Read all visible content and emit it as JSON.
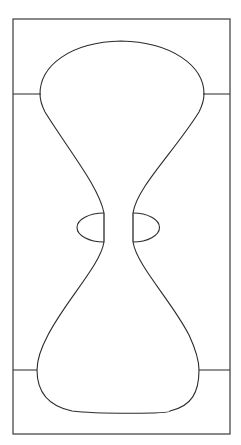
{
  "figure": {
    "title": "Hourglass outline drawing",
    "canvas": {
      "width": 241,
      "height": 445
    },
    "colors": {
      "background": "#ffffff",
      "frame_stroke": "#3a3a3a",
      "shape_stroke": "#2b2b2b"
    },
    "frame": {
      "name": "outer-rectangle",
      "x": 13,
      "y": 19,
      "width": 217,
      "height": 415
    },
    "ticks": [
      {
        "name": "tick-top-left",
        "x1": 13,
        "y1": 94,
        "x2": 41,
        "y2": 94
      },
      {
        "name": "tick-top-right",
        "x1": 203,
        "y1": 94,
        "x2": 230,
        "y2": 94
      },
      {
        "name": "tick-bottom-left",
        "x1": 13,
        "y1": 370,
        "x2": 37,
        "y2": 370
      },
      {
        "name": "tick-bottom-right",
        "x1": 199,
        "y1": 370,
        "x2": 230,
        "y2": 370
      }
    ],
    "upper_bulb": {
      "name": "upper-bulb-outline",
      "apex_y": 41,
      "shoulder_y": 94,
      "left_shoulder_x": 40,
      "right_shoulder_x": 204,
      "waist_top_y": 213,
      "waist_left_x": 104,
      "waist_right_x": 133,
      "path": "M 104,213 L 104,94.5 C 104,63 128,41.5 165,41.5 C 203,41.5 228,63 228,94.5 L 228,213"
    },
    "lower_bulb": {
      "name": "lower-bulb-outline",
      "base_y": 412,
      "shoulder_y": 370,
      "left_shoulder_x": 37,
      "right_shoulder_x": 199,
      "waist_bottom_y": 242,
      "waist_left_x": 104,
      "waist_right_x": 133
    },
    "waist_segments": [
      {
        "name": "waist-left-vertical",
        "x": 104,
        "y1": 213,
        "y2": 242
      },
      {
        "name": "waist-right-vertical",
        "x": 133,
        "y1": 213,
        "y2": 242
      }
    ],
    "ellipses": [
      {
        "name": "left-waist-ellipse",
        "left_x": 50,
        "right_x": 104,
        "top_y": 213,
        "bottom_y": 242,
        "cx": 77,
        "cy": 227.5,
        "rx": 27,
        "ry": 14.5
      },
      {
        "name": "right-waist-ellipse",
        "left_x": 133,
        "right_x": 186,
        "top_y": 213,
        "bottom_y": 242,
        "cx": 159.5,
        "cy": 227.5,
        "rx": 26.5,
        "ry": 14.5
      }
    ]
  }
}
